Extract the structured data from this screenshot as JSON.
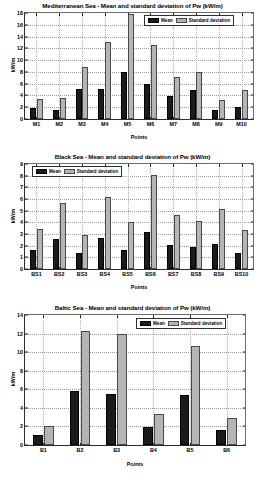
{
  "figure": {
    "background": "#ffffff",
    "mean_color": "#1b1b1b",
    "sd_color": "#b5b5b5",
    "legend": {
      "mean_label": "Mean",
      "sd_label": "Standard deviation"
    }
  },
  "chart_data": [
    {
      "type": "bar",
      "title": "Mediterranean Sea - Mean and standard deviation of Pw (kW/m)",
      "xlabel": "Points",
      "ylabel": "kW/m",
      "ylim": [
        0,
        18
      ],
      "yticks": [
        0,
        2,
        4,
        6,
        8,
        10,
        12,
        14,
        16,
        18
      ],
      "grid": true,
      "legend_position": "top-right",
      "categories": [
        "M1",
        "M2",
        "M3",
        "M4",
        "M5",
        "M6",
        "M7",
        "M8",
        "M9",
        "M10"
      ],
      "series": [
        {
          "name": "Mean",
          "values": [
            1.9,
            1.6,
            5.1,
            5.1,
            8.0,
            6.0,
            3.9,
            4.9,
            1.6,
            2.1
          ]
        },
        {
          "name": "Standard deviation",
          "values": [
            3.4,
            3.5,
            8.9,
            13.1,
            17.9,
            12.6,
            7.2,
            7.9,
            3.3,
            4.9
          ]
        }
      ]
    },
    {
      "type": "bar",
      "title": "Black Sea - Mean and standard deviation of Pw (kW/m)",
      "xlabel": "Points",
      "ylabel": "kW/m",
      "ylim": [
        0,
        9
      ],
      "yticks": [
        0,
        1,
        2,
        3,
        4,
        5,
        6,
        7,
        8,
        9
      ],
      "grid": true,
      "legend_position": "top-left",
      "categories": [
        "BS1",
        "BS2",
        "BS3",
        "BS4",
        "BS5",
        "BS6",
        "BS7",
        "BS8",
        "BS9",
        "BS10"
      ],
      "series": [
        {
          "name": "Mean",
          "values": [
            1.6,
            2.6,
            1.4,
            2.65,
            1.62,
            3.2,
            2.02,
            1.9,
            2.12,
            1.36
          ]
        },
        {
          "name": "Standard deviation",
          "values": [
            3.4,
            5.7,
            2.95,
            6.2,
            4.05,
            8.05,
            4.62,
            4.12,
            5.12,
            3.38
          ]
        }
      ]
    },
    {
      "type": "bar",
      "title": "Baltic Sea - Mean and standard deviation of Pw (kW/m)",
      "xlabel": "Points",
      "ylabel": "kW/m",
      "ylim": [
        0,
        14
      ],
      "yticks": [
        0,
        2,
        4,
        6,
        8,
        10,
        12,
        14
      ],
      "grid": true,
      "legend_position": "top-right",
      "categories": [
        "B1",
        "B2",
        "B3",
        "B4",
        "B5",
        "B6"
      ],
      "series": [
        {
          "name": "Mean",
          "values": [
            1.1,
            5.8,
            5.45,
            1.92,
            5.42,
            1.6
          ]
        },
        {
          "name": "Standard deviation",
          "values": [
            2.0,
            12.3,
            12.0,
            3.38,
            10.7,
            2.9
          ]
        }
      ]
    }
  ]
}
